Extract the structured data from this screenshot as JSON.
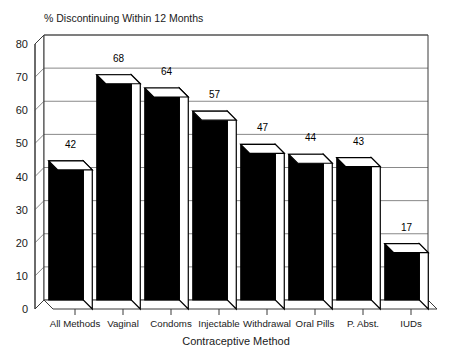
{
  "chart_data": {
    "type": "bar",
    "title": "% Discontinuing Within 12 Months",
    "xlabel": "Contraceptive Method",
    "ylabel": "",
    "categories": [
      "All Methods",
      "Vaginal",
      "Condoms",
      "Injectable",
      "Withdrawal",
      "Oral Pills",
      "P. Abst.",
      "IUDs"
    ],
    "values": [
      42,
      68,
      64,
      57,
      47,
      44,
      43,
      17
    ],
    "value_labels": [
      "42",
      "68",
      "64",
      "57",
      "47",
      "44",
      "43",
      "17"
    ],
    "ylim": [
      0,
      80
    ],
    "ytick_labels": [
      "0",
      "10",
      "20",
      "30",
      "40",
      "50",
      "60",
      "70",
      "80"
    ],
    "ytick_values": [
      0,
      10,
      20,
      30,
      40,
      50,
      60,
      70,
      80
    ],
    "grid": true,
    "legend": "none",
    "style": "3d-columns",
    "colors": {
      "bar_front": "#000000",
      "bar_top": "#ffffff",
      "bar_side": "#ffffff",
      "background": "#ffffff",
      "axis": "#3a3a3a",
      "grid": "#6b6b6b",
      "text": "#1a1a1a"
    }
  }
}
